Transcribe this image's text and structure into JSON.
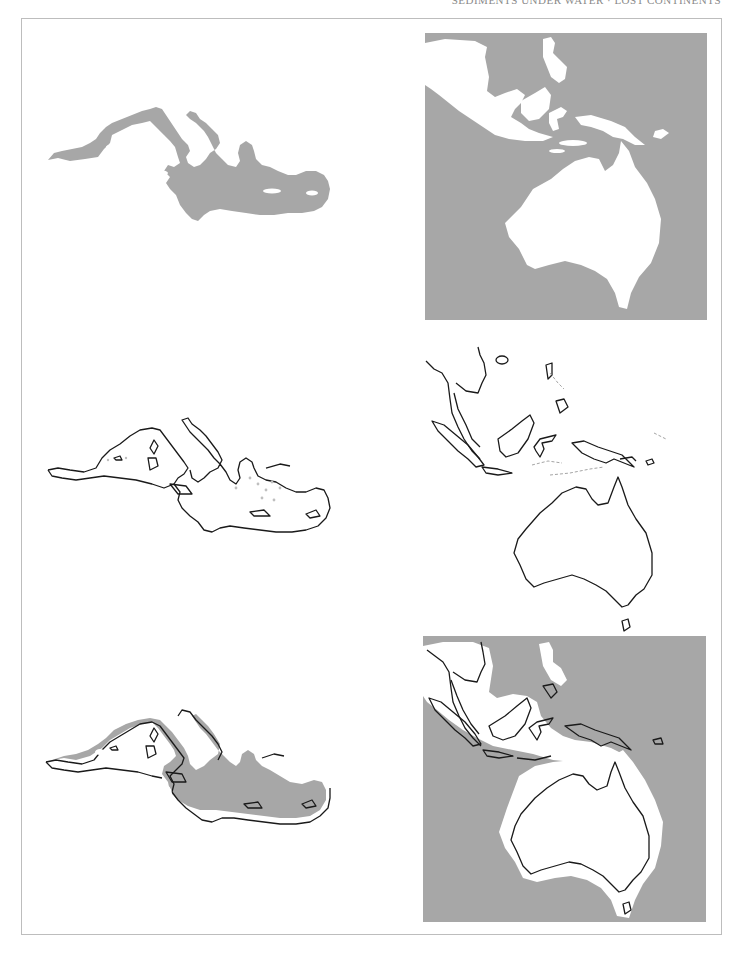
{
  "page": {
    "running_head": "SEDIMENTS UNDER WATER · LOST CONTINENTS",
    "colors": {
      "sea_fill": "#a7a7a7",
      "land": "#ffffff",
      "coastline": "#1a1a1a",
      "frame": "#bdbdbd"
    }
  },
  "panels": [
    {
      "id": "med-fill",
      "region": "Mediterranean Sea",
      "style": "filled sea (gray)"
    },
    {
      "id": "aus-fill",
      "region": "Southeast Asia and Australia",
      "style": "filled sea (gray) with white land"
    },
    {
      "id": "med-outline",
      "region": "Mediterranean Sea",
      "style": "coastline outline"
    },
    {
      "id": "aus-outline",
      "region": "Southeast Asia and Australia",
      "style": "coastline outline"
    },
    {
      "id": "med-overlay",
      "region": "Mediterranean Sea",
      "style": "filled sea with coastline overlay"
    },
    {
      "id": "aus-overlay",
      "region": "Southeast Asia and Australia",
      "style": "filled sea with coastline overlay"
    }
  ]
}
